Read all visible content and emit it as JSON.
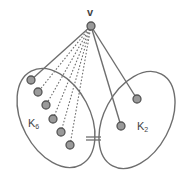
{
  "diagram": {
    "title": "",
    "colors": {
      "stroke": "#6e6e6e",
      "node_fill": "#9a9a9a",
      "node_stroke": "#555555",
      "label": "#444444"
    },
    "apex": {
      "label": "v",
      "x": 91,
      "y": 26
    },
    "groups": [
      {
        "label": "K",
        "subscript": "6",
        "label_x": 33,
        "label_y": 123
      },
      {
        "label": "K",
        "subscript": "2",
        "label_x": 140,
        "label_y": 129
      }
    ],
    "k6_nodes": [
      {
        "x": 31,
        "y": 80,
        "edge": "solid"
      },
      {
        "x": 38,
        "y": 92,
        "edge": "dotted"
      },
      {
        "x": 46,
        "y": 105,
        "edge": "dotted"
      },
      {
        "x": 53,
        "y": 119,
        "edge": "dotted"
      },
      {
        "x": 61,
        "y": 132,
        "edge": "dotted"
      },
      {
        "x": 70,
        "y": 145,
        "edge": "dotted"
      }
    ],
    "k2_nodes": [
      {
        "x": 137,
        "y": 99,
        "edge": "solid"
      },
      {
        "x": 121,
        "y": 126,
        "edge": "solid"
      }
    ]
  }
}
